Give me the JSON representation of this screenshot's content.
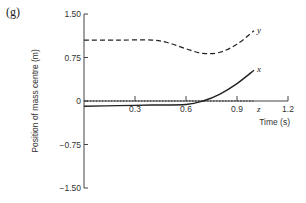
{
  "panel_label": "(g)",
  "chart_data": {
    "type": "line",
    "title": "",
    "xlabel": "Time (s)",
    "ylabel": "Position of mass centre (m)",
    "xlim": [
      0,
      1.2
    ],
    "ylim": [
      -1.5,
      1.5
    ],
    "x_ticks": [
      "0.3",
      "0.6",
      "0.9",
      "1.2"
    ],
    "y_ticks": [
      "1.50",
      "0.75",
      "0",
      "−0.75",
      "−1.50"
    ],
    "grid": false,
    "legend": "inline labels at line ends",
    "series": [
      {
        "name": "y",
        "style": "dashed",
        "x": [
          0,
          0.2,
          0.4,
          0.5,
          0.6,
          0.7,
          0.8,
          0.9,
          1.0
        ],
        "values": [
          1.05,
          1.05,
          1.05,
          1.0,
          0.9,
          0.82,
          0.84,
          0.98,
          1.21
        ]
      },
      {
        "name": "x",
        "style": "solid",
        "x": [
          0,
          0.2,
          0.4,
          0.6,
          0.7,
          0.8,
          0.9,
          1.0
        ],
        "values": [
          -0.09,
          -0.08,
          -0.07,
          -0.06,
          0.0,
          0.12,
          0.3,
          0.53
        ]
      },
      {
        "name": "z",
        "style": "dotted",
        "x": [
          0,
          1.0
        ],
        "values": [
          0,
          0
        ]
      }
    ]
  }
}
